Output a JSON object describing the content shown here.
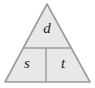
{
  "figure": {
    "name": "formula-triangle",
    "fill_color": "#e8e8e8",
    "stroke_color": "#9a9a9a",
    "text_color": "#1a1a1a",
    "background_color": "#ffffff"
  },
  "cells": {
    "top": {
      "label": "d",
      "position": "top"
    },
    "bottom_left": {
      "label": "s",
      "position": "bottom-left"
    },
    "bottom_right": {
      "label": "t",
      "position": "bottom-right"
    }
  },
  "geometry": {
    "apex_x": 47,
    "apex_y": 4,
    "base_left_x": 5,
    "base_right_x": 90,
    "base_y": 82,
    "horizontal_divider_y": 48,
    "vertical_divider_x": 46
  }
}
